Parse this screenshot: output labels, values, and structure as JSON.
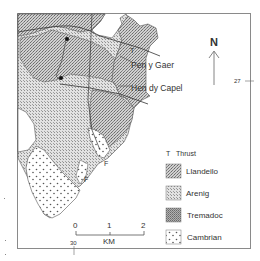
{
  "map": {
    "north_label": "N",
    "grid_labels": {
      "easting": "30",
      "northing": "27"
    },
    "places": [
      {
        "name": "Pen y Gaer"
      },
      {
        "name": "Hen dy Capel"
      }
    ],
    "annotations": {
      "thrust_marker": "T",
      "fault_marker_1": "F",
      "fault_marker_2": "F"
    },
    "scale": {
      "ticks": [
        "0",
        "1",
        "2"
      ],
      "unit": "KM"
    },
    "legend": {
      "thrust": {
        "symbol": "T",
        "label": "Thrust"
      },
      "units": [
        {
          "label": "Llandeilo",
          "pattern": "fine-dense-stipple",
          "color": "#bcbcbc"
        },
        {
          "label": "Arenig",
          "pattern": "fine-light-stipple",
          "color": "#d6d6d6"
        },
        {
          "label": "Tremadoc",
          "pattern": "dark-stipple",
          "color": "#a8a8a8"
        },
        {
          "label": "Cambrian",
          "pattern": "open-dots",
          "color": "#ffffff"
        }
      ]
    },
    "colors": {
      "frame": "#888888",
      "ink": "#333333",
      "llandeilo": "#bcbcbc",
      "arenig": "#d4d4d4",
      "tremadoc": "#a6a6a6"
    }
  }
}
